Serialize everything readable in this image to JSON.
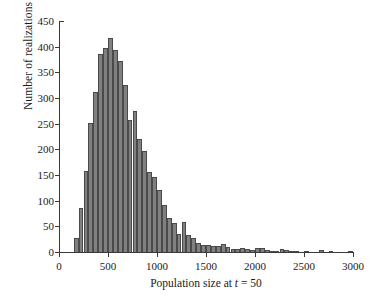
{
  "chart_data": {
    "type": "bar",
    "title": "",
    "subtitle": "",
    "xlabel": "Population size at t = 50",
    "xlabel_parts": {
      "prefix": "Population size at ",
      "italic": "t",
      "suffix": " = 50"
    },
    "ylabel": "Number of realizations",
    "xlim": [
      0,
      3000
    ],
    "ylim": [
      0,
      450
    ],
    "xticks": [
      0,
      500,
      1000,
      1500,
      2000,
      2500,
      3000
    ],
    "xtick_labels": [
      "0",
      "500",
      "1000",
      "1500",
      "2000",
      "2500",
      "3000"
    ],
    "yticks": [
      0,
      50,
      100,
      150,
      200,
      250,
      300,
      350,
      400,
      450
    ],
    "ytick_labels": [
      "0",
      "50",
      "100",
      "150",
      "200",
      "250",
      "300",
      "350",
      "400",
      "450"
    ],
    "grid": false,
    "legend": null,
    "bin_width": 50,
    "bar_color": "#808080",
    "bar_edge_color": "#4a4a4a",
    "axis_color": "#3a3a3a",
    "bin_starts": [
      150,
      200,
      250,
      300,
      350,
      400,
      450,
      500,
      550,
      600,
      650,
      700,
      750,
      800,
      850,
      900,
      950,
      1000,
      1050,
      1100,
      1150,
      1200,
      1250,
      1300,
      1350,
      1400,
      1450,
      1500,
      1550,
      1600,
      1650,
      1700,
      1750,
      1800,
      1850,
      1900,
      1950,
      2000,
      2050,
      2100,
      2150,
      2200,
      2250,
      2300,
      2350,
      2400,
      2450,
      2500,
      2550,
      2600,
      2650,
      2700,
      2750,
      2800,
      2850,
      2900,
      2950
    ],
    "values": [
      27,
      86,
      157,
      251,
      312,
      386,
      398,
      417,
      393,
      372,
      325,
      257,
      275,
      220,
      196,
      155,
      146,
      120,
      92,
      66,
      56,
      36,
      59,
      33,
      28,
      18,
      13,
      13,
      12,
      12,
      16,
      9,
      6,
      5,
      7,
      5,
      3,
      8,
      7,
      3,
      1,
      1,
      5,
      3,
      2,
      1,
      0,
      1,
      0,
      0,
      3,
      0,
      1,
      0,
      0,
      0,
      1
    ],
    "peak_value": 417,
    "peak_bin": 500,
    "n_bins": 57,
    "distribution": "right-skewed"
  }
}
